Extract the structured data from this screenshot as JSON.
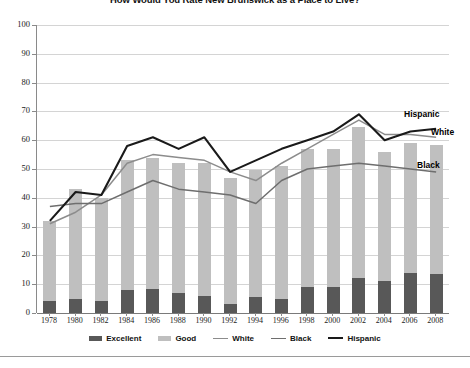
{
  "title": "How Would You Rate New Brunswick as a Place to Live?",
  "legend": {
    "items": [
      {
        "label": "Excellent",
        "marker": "bar",
        "color": "#585858"
      },
      {
        "label": "Good",
        "marker": "bar",
        "color": "#bfbfbf"
      },
      {
        "label": "White",
        "marker": "line",
        "color": "#8c8c8c"
      },
      {
        "label": "Black",
        "marker": "line",
        "color": "#6e6e6e"
      },
      {
        "label": "Hispanic",
        "marker": "line",
        "color": "#1a1a1a"
      }
    ]
  },
  "callouts": [
    {
      "name": "hispanic",
      "text": "Hispanic"
    },
    {
      "name": "white",
      "text": "White"
    },
    {
      "name": "black",
      "text": "Black"
    }
  ],
  "chart_data": {
    "type": "bar",
    "title": "How Would You Rate New Brunswick as a Place to Live?",
    "xlabel": "",
    "ylabel": "",
    "ylim": [
      0,
      100
    ],
    "yticks": [
      0,
      10,
      20,
      30,
      40,
      50,
      60,
      70,
      80,
      90,
      100
    ],
    "grid": true,
    "legend_position": "bottom",
    "stacked": true,
    "categories": [
      1978,
      1980,
      1982,
      1984,
      1986,
      1988,
      1990,
      1992,
      1994,
      1996,
      1998,
      2000,
      2002,
      2004,
      2006,
      2008
    ],
    "series": [
      {
        "name": "Excellent",
        "kind": "bar",
        "color": "#585858",
        "values": [
          4,
          5,
          4,
          8,
          8.5,
          7,
          6,
          3,
          5.5,
          5,
          9,
          9,
          12,
          11,
          14,
          13.5
        ]
      },
      {
        "name": "Good",
        "kind": "bar",
        "color": "#bfbfbf",
        "values": [
          28,
          38,
          36,
          45,
          45.5,
          45,
          46,
          44,
          44,
          46,
          48,
          48,
          52.5,
          45,
          45,
          45
        ]
      },
      {
        "name": "White",
        "kind": "line",
        "color": "#8c8c8c",
        "values": [
          31,
          35,
          41,
          52,
          55,
          54,
          53,
          49,
          46,
          52,
          57,
          62,
          67,
          62,
          62,
          61
        ]
      },
      {
        "name": "Black",
        "kind": "line",
        "color": "#6e6e6e",
        "values": [
          37,
          38,
          38,
          42,
          46,
          43,
          42,
          41,
          38,
          46,
          50,
          51,
          52,
          51,
          50,
          49
        ]
      },
      {
        "name": "Hispanic",
        "kind": "line",
        "color": "#1a1a1a",
        "values": [
          32,
          42,
          41,
          58,
          61,
          57,
          61,
          49,
          53,
          57,
          60,
          63,
          69,
          60,
          63,
          64
        ]
      }
    ],
    "bar_totals": [
      32,
      43,
      40,
      53,
      54,
      52,
      52,
      47,
      49.5,
      51,
      57,
      57,
      64.5,
      56,
      59,
      58.5
    ]
  }
}
